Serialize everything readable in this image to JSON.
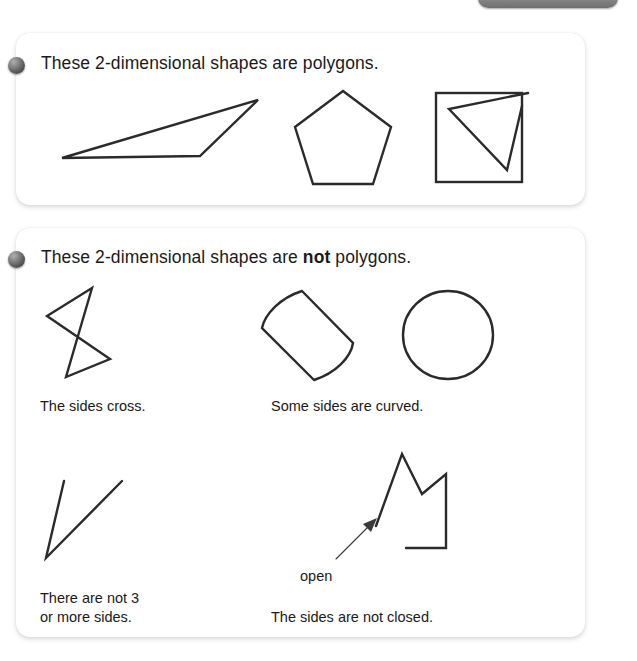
{
  "top_tab": {
    "name": "tab-handle",
    "color": "#8a8a8a"
  },
  "sections": [
    {
      "id": "polygons",
      "bullet": "bullet-sphere",
      "heading_prefix": "These 2-dimensional shapes are polygons.",
      "heading_bold": "",
      "heading_suffix": "",
      "figures": [
        {
          "name": "triangle-shape",
          "caption": ""
        },
        {
          "name": "pentagon-shape",
          "caption": ""
        },
        {
          "name": "square-with-triangle-shape",
          "caption": ""
        }
      ]
    },
    {
      "id": "not-polygons",
      "bullet": "bullet-sphere",
      "heading_prefix": "These 2-dimensional shapes are ",
      "heading_bold": "not",
      "heading_suffix": " polygons.",
      "figures": [
        {
          "name": "crossing-sides-shape",
          "caption": "The sides cross."
        },
        {
          "name": "curved-sides-shape",
          "caption": "Some sides are curved."
        },
        {
          "name": "circle-shape",
          "caption": ""
        },
        {
          "name": "two-sides-shape",
          "caption": "There are not 3\nor more sides."
        },
        {
          "name": "open-shape",
          "caption": "The sides are not closed."
        }
      ],
      "annotation": {
        "label": "open",
        "arrow": "arrow-icon"
      }
    }
  ],
  "colors": {
    "stroke": "#2b2b2b",
    "text": "#1a1a1a",
    "card_background": "#ffffff",
    "page_background": "#ffffff",
    "bullet": "#5a5a5a"
  }
}
